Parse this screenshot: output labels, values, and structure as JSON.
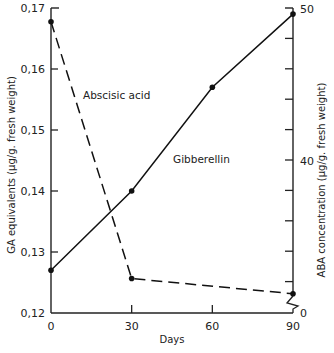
{
  "chart_data": {
    "type": "line",
    "title": "",
    "xlabel": "Days",
    "ylabel_left": "GA equivalents (μg/g. fresh weight)",
    "ylabel_right": "ABA concentration (μg/g. fresh weight)",
    "x": [
      0,
      30,
      60,
      90
    ],
    "x_ticks": [
      "0",
      "30",
      "60",
      "90"
    ],
    "y_left_ticks": [
      "0.12",
      "0.13",
      "0.14",
      "0.15",
      "0.16",
      "0.17"
    ],
    "y_left_range": [
      0.12,
      0.17
    ],
    "y_right_ticks_labeled": [
      "0",
      "40",
      "50"
    ],
    "y_right_range_broken": [
      30,
      50
    ],
    "y_right_break": true,
    "grid": false,
    "legend": "inline labels",
    "series": [
      {
        "name": "Gibberellin",
        "axis": "left",
        "style": "solid",
        "x": [
          0,
          30,
          60,
          90
        ],
        "values": [
          0.127,
          0.14,
          0.157,
          0.169
        ]
      },
      {
        "name": "Abscisic acid",
        "axis": "right",
        "style": "dashed",
        "x": [
          0,
          30,
          90
        ],
        "values": [
          49.1,
          32.2,
          31.2
        ]
      }
    ],
    "annotations": [
      "Abscisic acid",
      "Gibberellin"
    ]
  }
}
